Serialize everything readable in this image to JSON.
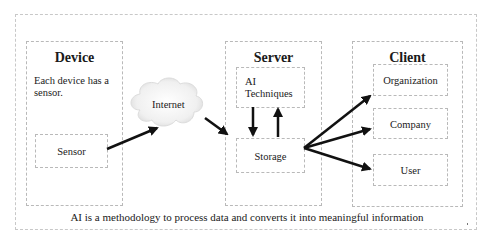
{
  "diagram": {
    "device": {
      "title": "Device",
      "description": "Each device has a sensor.",
      "sensor_label": "Sensor"
    },
    "internet": {
      "label": "Internet"
    },
    "server": {
      "title": "Server",
      "ai_techniques_line1": "AI",
      "ai_techniques_line2": "Techniques",
      "storage_label": "Storage"
    },
    "client": {
      "title": "Client",
      "items": [
        {
          "label": "Organization"
        },
        {
          "label": "Company"
        },
        {
          "label": "User"
        }
      ]
    },
    "caption": "AI is a methodology to process data and converts it into meaningful information",
    "edges": [
      {
        "from": "Sensor",
        "to": "Internet"
      },
      {
        "from": "Internet",
        "to": "Storage"
      },
      {
        "from": "AI Techniques",
        "to": "Storage"
      },
      {
        "from": "Storage",
        "to": "AI Techniques"
      },
      {
        "from": "Storage",
        "to": "Organization"
      },
      {
        "from": "Storage",
        "to": "Company"
      },
      {
        "from": "Storage",
        "to": "User"
      }
    ],
    "colors": {
      "arrow": "#111111",
      "border": "#b9b9b9",
      "cloud_fill": "#eeeeee"
    }
  }
}
